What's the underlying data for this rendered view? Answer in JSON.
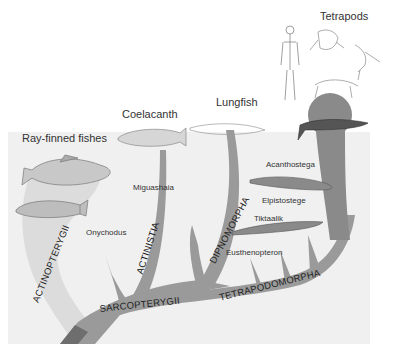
{
  "diagram": {
    "colors": {
      "background": "#ffffff",
      "water_band": "#efefef",
      "actinopterygii_region": "#dcdcdc",
      "branch_main": "#9a9a9a",
      "branch_dark": "#6e6e6e",
      "tetrapod_blob": "#8a8a8a",
      "text": "#333333"
    },
    "top_labels": {
      "ray_finned": "Ray-finned fishes",
      "coelacanth": "Coelacanth",
      "lungfish": "Lungfish",
      "tetrapods": "Tetrapods"
    },
    "genus_labels": {
      "miguashaia": "Miguashaia",
      "onychodus": "Onychodus",
      "acanthostega": "Acanthostega",
      "elpistostege": "Elpistostege",
      "tiktaalik": "Tiktaalik",
      "eusthenopteron": "Eusthenopteron"
    },
    "clade_labels": {
      "actinopterygii": "ACTINOPTERYGII",
      "actinistia": "ACTINISTIA",
      "dipnomorpha": "DIPNOMORPHA",
      "sarcopterygii": "SARCOPTERYGII",
      "tetrapodomorpha": "TETRAPODOMORPHA"
    },
    "icons": [
      "perch-fish",
      "flatfish",
      "coelacanth-fish",
      "lungfish",
      "acanthostega",
      "tiktaalik",
      "human-skeleton",
      "frog-skeleton",
      "bird-skeleton",
      "reptile-skeleton",
      "lizard"
    ]
  }
}
